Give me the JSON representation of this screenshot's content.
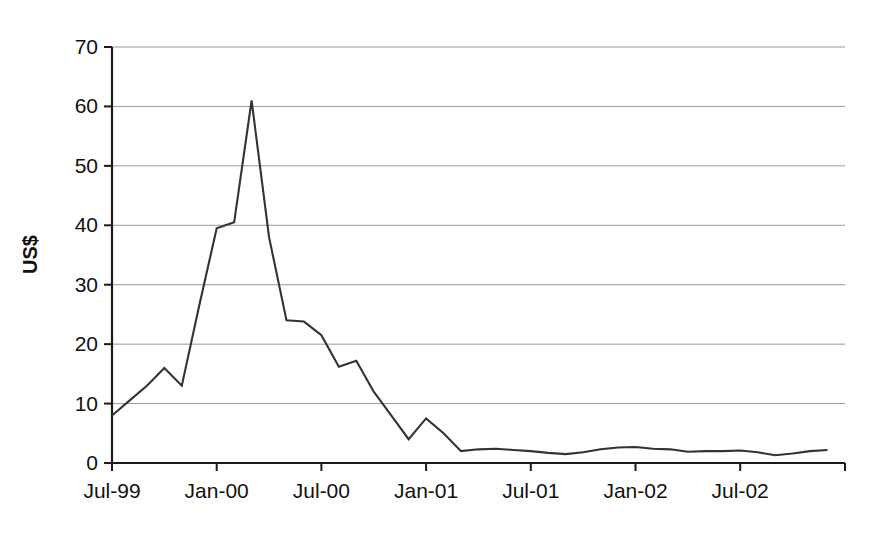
{
  "chart_data": {
    "type": "line",
    "title": "",
    "subtitle": "",
    "xlabel": "",
    "ylabel": "US$",
    "ylim": [
      0,
      70
    ],
    "yticks": [
      0,
      10,
      20,
      30,
      40,
      50,
      60,
      70
    ],
    "ytick_labels": [
      "0",
      "10",
      "20",
      "30",
      "40",
      "50",
      "60",
      "70"
    ],
    "xtick_labels": [
      "Jul-99",
      "Jan-00",
      "Jul-00",
      "Jan-01",
      "Jul-01",
      "Jan-02",
      "Jul-02"
    ],
    "xtick_values": [
      "Jul-99",
      "Jan-00",
      "Jul-00",
      "Jan-01",
      "Jul-01",
      "Jan-02",
      "Jul-02"
    ],
    "grid": true,
    "grid_axis": "y",
    "legend": false,
    "legend_position": "none",
    "line_color": "#333333",
    "grid_color": "#999999",
    "axis_color": "#000000",
    "background": "#ffffff",
    "x": [
      "Jul-99",
      "Aug-99",
      "Sep-99",
      "Oct-99",
      "Nov-99",
      "Dec-99",
      "Jan-00",
      "Feb-00",
      "Mar-00",
      "Apr-00",
      "May-00",
      "Jun-00",
      "Jul-00",
      "Aug-00",
      "Sep-00",
      "Oct-00",
      "Nov-00",
      "Dec-00",
      "Jan-01",
      "Feb-01",
      "Mar-01",
      "Apr-01",
      "May-01",
      "Jun-01",
      "Jul-01",
      "Aug-01",
      "Sep-01",
      "Oct-01",
      "Nov-01",
      "Dec-01",
      "Jan-02",
      "Feb-02",
      "Mar-02",
      "Apr-02",
      "May-02",
      "Jun-02",
      "Jul-02",
      "Aug-02",
      "Sep-02",
      "Oct-02",
      "Nov-02",
      "Dec-02"
    ],
    "values": [
      8.0,
      10.5,
      13.0,
      16.0,
      13.0,
      26.5,
      39.5,
      40.5,
      61.0,
      38.0,
      24.0,
      23.8,
      21.5,
      16.2,
      17.2,
      12.0,
      8.0,
      4.0,
      7.5,
      5.0,
      2.0,
      2.3,
      2.4,
      2.2,
      2.0,
      1.7,
      1.5,
      1.8,
      2.3,
      2.6,
      2.7,
      2.4,
      2.3,
      1.9,
      2.0,
      2.0,
      2.1,
      1.8,
      1.3,
      1.6,
      2.0,
      2.2
    ],
    "series": [
      {
        "name": "US$",
        "values": [
          8.0,
          10.5,
          13.0,
          16.0,
          13.0,
          26.5,
          39.5,
          40.5,
          61.0,
          38.0,
          24.0,
          23.8,
          21.5,
          16.2,
          17.2,
          12.0,
          8.0,
          4.0,
          7.5,
          5.0,
          2.0,
          2.3,
          2.4,
          2.2,
          2.0,
          1.7,
          1.5,
          1.8,
          2.3,
          2.6,
          2.7,
          2.4,
          2.3,
          1.9,
          2.0,
          2.0,
          2.1,
          1.8,
          1.3,
          1.6,
          2.0,
          2.2
        ]
      }
    ],
    "annotations": {
      "peak_label": "61.0",
      "start_label": "8.0",
      "end_label": "2.2"
    }
  }
}
